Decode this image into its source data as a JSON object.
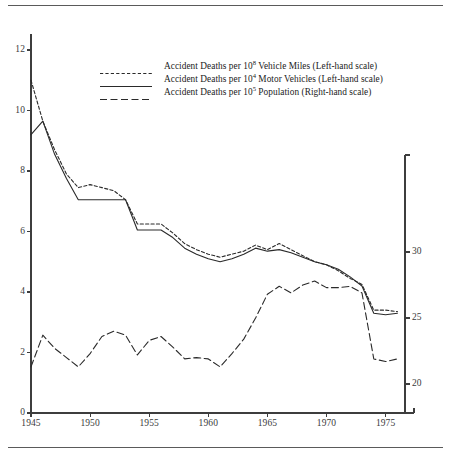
{
  "figure": {
    "rules": [
      "top-rule",
      "bottom-rule"
    ]
  },
  "legend": {
    "items": [
      {
        "key": "dotted-line-key",
        "prefix": "Accident Deaths per 10",
        "exponent": "8",
        "suffix": " Vehicle Miles (Left-hand scale)",
        "style": "dotted"
      },
      {
        "key": "solid-line-key",
        "prefix": "Accident Deaths per 10",
        "exponent": "4",
        "suffix": " Motor Vehicles (Left-hand scale)",
        "style": "solid"
      },
      {
        "key": "dashed-line-key",
        "prefix": "Accident Deaths per 10",
        "exponent": "5",
        "suffix": " Population (Right-hand scale)",
        "style": "dashed"
      }
    ]
  },
  "chart_data": {
    "type": "line",
    "title": "",
    "xlabel": "",
    "ylabel": "",
    "grid": false,
    "legend_position": "top-center",
    "xlim": [
      1945,
      1977
    ],
    "x_ticks": [
      1945,
      1950,
      1955,
      1960,
      1965,
      1970,
      1975
    ],
    "x_tick_labels": [
      "1945",
      "1950",
      "1955",
      "1960",
      "1965",
      "1970",
      "1975"
    ],
    "left_axis": {
      "label": "",
      "ylim": [
        0,
        12.8
      ],
      "ticks": [
        0,
        2,
        4,
        6,
        8,
        10,
        12
      ],
      "tick_labels": [
        "0",
        "2",
        "4",
        "6",
        "8",
        "10",
        "12"
      ]
    },
    "right_axis": {
      "label": "",
      "ylim": [
        17.5,
        37.5
      ],
      "ticks": [
        20,
        25,
        30
      ],
      "tick_labels": [
        "20",
        "25",
        "30"
      ]
    },
    "x": [
      1945,
      1946,
      1947,
      1948,
      1949,
      1950,
      1951,
      1952,
      1953,
      1954,
      1955,
      1956,
      1957,
      1958,
      1959,
      1960,
      1961,
      1962,
      1963,
      1964,
      1965,
      1966,
      1967,
      1968,
      1969,
      1970,
      1971,
      1972,
      1973,
      1974,
      1975,
      1976
    ],
    "series": [
      {
        "name": "Accident Deaths per 10^8 Vehicle Miles (Left-hand scale)",
        "axis": "left",
        "style": "dotted",
        "values": [
          11.0,
          9.65,
          8.7,
          7.9,
          7.45,
          7.55,
          7.45,
          7.35,
          7.05,
          6.25,
          6.25,
          6.25,
          5.95,
          5.6,
          5.4,
          5.25,
          5.15,
          5.25,
          5.35,
          5.55,
          5.4,
          5.6,
          5.4,
          5.2,
          5.0,
          4.9,
          4.7,
          4.45,
          4.25,
          3.4,
          3.4,
          3.35
        ]
      },
      {
        "name": "Accident Deaths per 10^4 Motor Vehicles (Left-hand scale)",
        "axis": "left",
        "style": "solid",
        "values": [
          9.2,
          9.65,
          8.55,
          7.75,
          7.05,
          7.05,
          7.05,
          7.05,
          7.05,
          6.05,
          6.05,
          6.05,
          5.8,
          5.45,
          5.25,
          5.1,
          5.0,
          5.1,
          5.25,
          5.45,
          5.35,
          5.4,
          5.3,
          5.15,
          5.0,
          4.9,
          4.75,
          4.5,
          4.2,
          3.3,
          3.25,
          3.3
        ]
      },
      {
        "name": "Accident Deaths per 10^5 Population (Right-hand scale)",
        "axis": "right",
        "style": "dashed",
        "values": [
          21.3,
          23.7,
          22.7,
          22.0,
          21.3,
          22.3,
          23.6,
          24.0,
          23.7,
          22.2,
          23.3,
          23.6,
          22.8,
          21.9,
          22.0,
          21.9,
          21.3,
          22.3,
          23.4,
          25.0,
          26.8,
          27.4,
          26.9,
          27.5,
          27.8,
          27.3,
          27.3,
          27.4,
          26.9,
          21.9,
          21.7,
          21.9
        ]
      }
    ]
  }
}
